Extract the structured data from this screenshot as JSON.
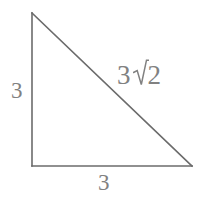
{
  "figure": {
    "kind": "right-triangle-diagram",
    "background_color": "#ffffff",
    "line_color": "#6b6b6b",
    "label_color": "#818181",
    "width": 206,
    "height": 199,
    "vertices": {
      "top": [
        32,
        13
      ],
      "bottom_left": [
        32,
        166
      ],
      "bottom_right": [
        192,
        166
      ]
    },
    "labels": {
      "leg_vertical": "3",
      "leg_horizontal": "3",
      "hypotenuse_coefficient": "3",
      "hypotenuse_radicand": "2",
      "hypotenuse_full": "3√2"
    }
  }
}
